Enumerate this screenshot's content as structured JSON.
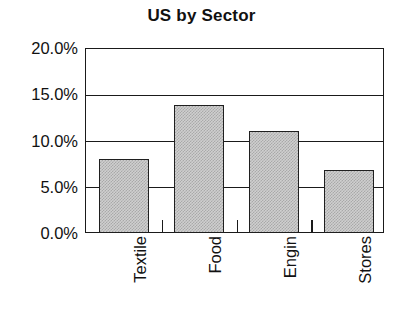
{
  "chart_data": {
    "type": "bar",
    "title": "US by Sector",
    "xlabel": "",
    "ylabel": "",
    "categories": [
      "Textile",
      "Food",
      "Engin",
      "Stores"
    ],
    "values": [
      8.0,
      13.8,
      11.0,
      6.8
    ],
    "value_unit": "%",
    "ylim": [
      0.0,
      20.0
    ],
    "ytick_values": [
      0.0,
      5.0,
      10.0,
      15.0,
      20.0
    ],
    "ytick_labels": [
      "0.0%",
      "5.0%",
      "10.0%",
      "15.0%",
      "20.0%"
    ],
    "grid": "horizontal",
    "legend": "none",
    "bar_fill_color": "#cfcfcf",
    "bar_border_color": "#1f1f1f",
    "axis_color": "#1a1a1a",
    "background_color": "#ffffff",
    "xlabel_rotation_degrees": 90
  }
}
